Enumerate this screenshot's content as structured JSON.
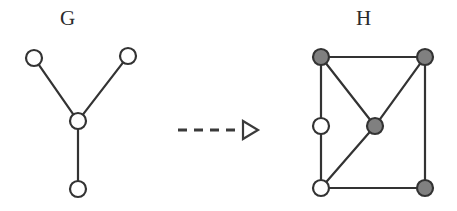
{
  "figure": {
    "title_left": "G",
    "title_right": "H",
    "background_color": "#ffffff",
    "stroke_color": "#333333",
    "node_open_fill": "#ffffff",
    "node_filled_fill": "#808080",
    "arrow_color": "#3a3a3a"
  },
  "graph_g": {
    "label": "G",
    "label_x": 78,
    "label_y": 20,
    "node_radius": 8,
    "node_style": "open",
    "nodes": [
      {
        "id": "g-upper-left",
        "x": 34,
        "y": 58,
        "fill": "open"
      },
      {
        "id": "g-upper-right",
        "x": 128,
        "y": 56,
        "fill": "open"
      },
      {
        "id": "g-center",
        "x": 78,
        "y": 121,
        "fill": "open"
      },
      {
        "id": "g-bottom",
        "x": 78,
        "y": 189,
        "fill": "open"
      }
    ],
    "edges": [
      {
        "from": "g-upper-left",
        "to": "g-center"
      },
      {
        "from": "g-upper-right",
        "to": "g-center"
      },
      {
        "from": "g-center",
        "to": "g-bottom"
      }
    ],
    "node_count": 4,
    "edge_count": 3
  },
  "graph_h": {
    "label": "H",
    "label_x": 372,
    "label_y": 20,
    "node_radius": 8,
    "nodes": [
      {
        "id": "h-top-left",
        "x": 321,
        "y": 57,
        "fill": "filled"
      },
      {
        "id": "h-top-right",
        "x": 425,
        "y": 57,
        "fill": "filled"
      },
      {
        "id": "h-left-middle",
        "x": 321,
        "y": 126,
        "fill": "open"
      },
      {
        "id": "h-center",
        "x": 375,
        "y": 126,
        "fill": "filled"
      },
      {
        "id": "h-bottom-left",
        "x": 321,
        "y": 188,
        "fill": "open"
      },
      {
        "id": "h-bottom-right",
        "x": 425,
        "y": 188,
        "fill": "filled"
      }
    ],
    "edges": [
      {
        "from": "h-top-left",
        "to": "h-top-right"
      },
      {
        "from": "h-top-left",
        "to": "h-left-middle"
      },
      {
        "from": "h-top-left",
        "to": "h-center"
      },
      {
        "from": "h-top-right",
        "to": "h-center"
      },
      {
        "from": "h-top-right",
        "to": "h-bottom-right"
      },
      {
        "from": "h-left-middle",
        "to": "h-bottom-left"
      },
      {
        "from": "h-center",
        "to": "h-bottom-left"
      },
      {
        "from": "h-bottom-left",
        "to": "h-bottom-right"
      }
    ],
    "node_count": 6,
    "edge_count": 8,
    "filled_node_count": 4,
    "open_node_count": 2
  },
  "arrow": {
    "style": "dashed",
    "head": "hollow-triangle",
    "x_start": 178,
    "x_end": 258,
    "y": 130,
    "dash_pattern": "9 7"
  }
}
